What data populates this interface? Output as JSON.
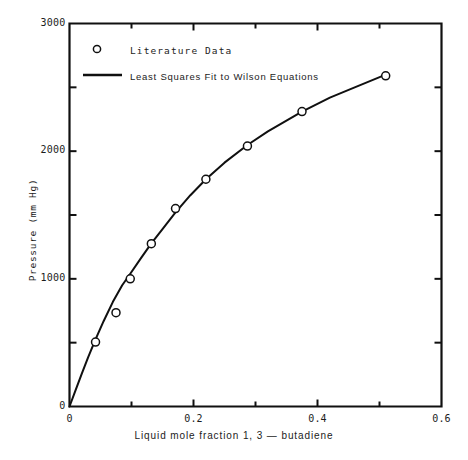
{
  "chart_data": {
    "type": "scatter",
    "title": "",
    "xlabel": "Liquid mole fraction 1, 3 — butadiene",
    "ylabel": "Pressure (mm Hg)",
    "xlim": [
      0,
      0.6
    ],
    "ylim": [
      0,
      3000
    ],
    "grid": false,
    "legend_position": "top-left-inside",
    "x_major_ticks": [
      0,
      0.2,
      0.4,
      0.6
    ],
    "x_major_tick_labels": [
      "0",
      "0.2",
      "0.4",
      "0.6"
    ],
    "x_minor_ticks": [
      0.1,
      0.3,
      0.5
    ],
    "y_major_ticks": [
      0,
      1000,
      2000,
      3000
    ],
    "y_major_tick_labels": [
      "0",
      "1000",
      "2000",
      "3000"
    ],
    "y_minor_ticks": [
      500,
      1500,
      2500
    ],
    "series": [
      {
        "name": "Literature Data",
        "marker": "open-circle",
        "color": "#101010",
        "points": [
          {
            "x": 0.042,
            "y": 505
          },
          {
            "x": 0.075,
            "y": 735
          },
          {
            "x": 0.098,
            "y": 1000
          },
          {
            "x": 0.132,
            "y": 1275
          },
          {
            "x": 0.171,
            "y": 1550
          },
          {
            "x": 0.22,
            "y": 1780
          },
          {
            "x": 0.287,
            "y": 2040
          },
          {
            "x": 0.375,
            "y": 2310
          },
          {
            "x": 0.51,
            "y": 2590
          }
        ]
      },
      {
        "name": "Least Squares Fit to Wilson Equations",
        "marker": "line",
        "color": "#101010",
        "points": [
          {
            "x": 0.0,
            "y": 0
          },
          {
            "x": 0.01,
            "y": 130
          },
          {
            "x": 0.02,
            "y": 260
          },
          {
            "x": 0.03,
            "y": 385
          },
          {
            "x": 0.042,
            "y": 525
          },
          {
            "x": 0.055,
            "y": 668
          },
          {
            "x": 0.07,
            "y": 820
          },
          {
            "x": 0.085,
            "y": 950
          },
          {
            "x": 0.098,
            "y": 1040
          },
          {
            "x": 0.115,
            "y": 1160
          },
          {
            "x": 0.132,
            "y": 1278
          },
          {
            "x": 0.15,
            "y": 1390
          },
          {
            "x": 0.171,
            "y": 1520
          },
          {
            "x": 0.195,
            "y": 1655
          },
          {
            "x": 0.22,
            "y": 1780
          },
          {
            "x": 0.25,
            "y": 1910
          },
          {
            "x": 0.287,
            "y": 2048
          },
          {
            "x": 0.32,
            "y": 2155
          },
          {
            "x": 0.375,
            "y": 2310
          },
          {
            "x": 0.42,
            "y": 2420
          },
          {
            "x": 0.46,
            "y": 2500
          },
          {
            "x": 0.51,
            "y": 2600
          }
        ]
      }
    ],
    "legend_entries": [
      {
        "label": "Literature Data",
        "marker": "open-circle"
      },
      {
        "label": "Least Squares Fit to Wilson Equations",
        "marker": "line"
      }
    ]
  },
  "axes": {
    "frame_color": "#101010",
    "background": "#ffffff"
  }
}
